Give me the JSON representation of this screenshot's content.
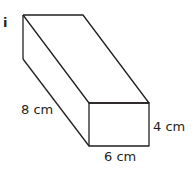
{
  "part_label": "i",
  "shape": "cuboid",
  "dimensions": {
    "length": "8 cm",
    "height": "4 cm",
    "width": "6 cm"
  },
  "colors": {
    "stroke": "#231f20",
    "background": "#ffffff"
  }
}
